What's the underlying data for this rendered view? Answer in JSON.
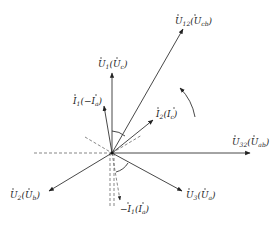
{
  "diagram": {
    "type": "phasor-diagram",
    "origin": [
      112,
      153
    ],
    "phasors": [
      {
        "id": "U12",
        "label": "U",
        "sub": "12",
        "alt": "U",
        "alt_sub": "cb",
        "tip": [
          183,
          29
        ],
        "style": "solid"
      },
      {
        "id": "U1",
        "label": "U",
        "sub": "1",
        "alt": "U",
        "alt_sub": "c",
        "tip": [
          112,
          73
        ],
        "style": "solid"
      },
      {
        "id": "I1",
        "label": "I",
        "sub": "1",
        "alt": "−I",
        "alt_sub": "a",
        "tip": [
          104,
          106
        ],
        "style": "solid"
      },
      {
        "id": "I2",
        "label": "I",
        "sub": "2",
        "alt": "I",
        "alt_sub": "c",
        "tip": [
          153,
          120
        ],
        "style": "solid"
      },
      {
        "id": "U32",
        "label": "U",
        "sub": "32",
        "alt": "U",
        "alt_sub": "ab",
        "tip": [
          250,
          153
        ],
        "style": "solid"
      },
      {
        "id": "U2",
        "label": "U",
        "sub": "2",
        "alt": "U",
        "alt_sub": "b",
        "tip": [
          49,
          191
        ],
        "style": "solid"
      },
      {
        "id": "U3",
        "label": "U",
        "sub": "3",
        "alt": "U",
        "alt_sub": "a",
        "tip": [
          182,
          191
        ],
        "style": "solid"
      },
      {
        "id": "negI1",
        "label": "−I",
        "sub": "1",
        "alt": "I",
        "alt_sub": "a",
        "tip": [
          120,
          200
        ],
        "style": "dashed"
      }
    ],
    "labels": {
      "U12": {
        "main": "U",
        "sub": "12",
        "paren": "U",
        "psub": "cb"
      },
      "U1": {
        "main": "U",
        "sub": "1",
        "paren": "U",
        "psub": "c"
      },
      "I1": {
        "main": "I",
        "sub": "1",
        "paren": "−I",
        "psub": "a"
      },
      "I2": {
        "main": "I",
        "sub": "2",
        "paren": "I",
        "psub": "c"
      },
      "U32": {
        "main": "U",
        "sub": "32",
        "paren": "U",
        "psub": "ab"
      },
      "U2": {
        "main": "U",
        "sub": "2",
        "paren": "U",
        "psub": "b"
      },
      "U3": {
        "main": "U",
        "sub": "3",
        "paren": "U",
        "psub": "a"
      },
      "negI1": {
        "main": "−I",
        "sub": "1",
        "paren": "I",
        "psub": "a"
      }
    },
    "rotation_arrow": "counter-clockwise",
    "colors": {
      "line": "#333333",
      "text": "#222222",
      "background": "#ffffff"
    }
  }
}
